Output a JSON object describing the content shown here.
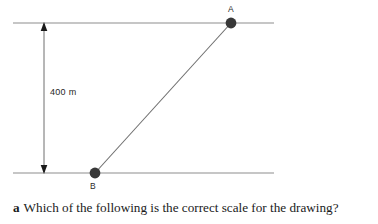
{
  "figure": {
    "points": [
      {
        "id": "A",
        "label": "A",
        "x": 231,
        "y": 23
      },
      {
        "id": "B",
        "label": "B",
        "x": 95,
        "y": 173
      }
    ],
    "dimension": {
      "label": "400 m",
      "value": 400,
      "unit": "m",
      "from_y": 23,
      "to_y": 173,
      "x": 44
    },
    "lines": {
      "top_line": {
        "x1": 13,
        "y1": 23,
        "x2": 274,
        "y2": 23
      },
      "bottom_line": {
        "x1": 13,
        "y1": 173,
        "x2": 274,
        "y2": 173
      },
      "connector": {
        "x1": 95,
        "y1": 173,
        "x2": 231,
        "y2": 23
      }
    },
    "colors": {
      "rule_line": "#b3b3b3",
      "connector_line": "#6e6e6e",
      "point_fill": "#383838",
      "arrow": "#1a1a1a",
      "text": "#1a1a1a"
    }
  },
  "question": {
    "letter": "a",
    "text": "Which of the following is the correct scale for the drawing?"
  }
}
